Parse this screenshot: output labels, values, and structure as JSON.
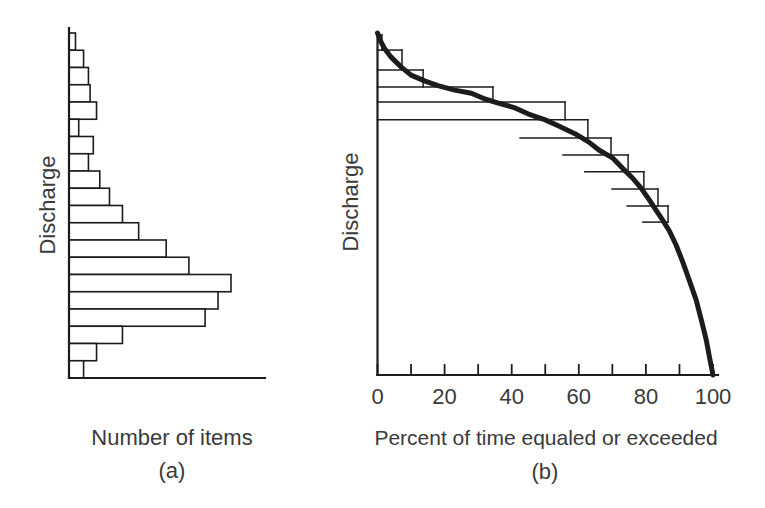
{
  "figure": {
    "background": "#ffffff",
    "line_color": "#1c1c1c",
    "text_color": "#3a3a3a"
  },
  "chart_data": [
    {
      "id": "a",
      "type": "bar",
      "orientation": "horizontal",
      "title": "",
      "xlabel": "Number of items",
      "ylabel": "Discharge",
      "caption": "(a)",
      "axis_numbers_shown": false,
      "grid": false,
      "value_units": "relative, max bar = 100",
      "values_top_to_bottom": [
        4,
        9,
        12,
        13,
        17,
        6,
        15,
        12,
        19,
        25,
        33,
        43,
        60,
        74,
        100,
        92,
        84,
        33,
        17,
        9
      ]
    },
    {
      "id": "b",
      "type": "line",
      "title": "",
      "xlabel": "Percent of time equaled or exceeded",
      "ylabel": "Discharge",
      "caption": "(b)",
      "grid": false,
      "xlim": [
        0,
        100
      ],
      "x_ticks": [
        0,
        20,
        40,
        60,
        80,
        100
      ],
      "x_minor_tick_step": 10,
      "y_axis_numbers_shown": false,
      "curve_note": "thick smooth flow-duration curve; y in relative discharge units (100 = axis top)",
      "curve": [
        [
          0,
          100
        ],
        [
          1,
          97.5
        ],
        [
          2,
          95.6
        ],
        [
          4,
          93.0
        ],
        [
          7,
          90.1
        ],
        [
          10,
          87.7
        ],
        [
          14,
          86.0
        ],
        [
          18,
          84.6
        ],
        [
          23,
          83.3
        ],
        [
          28,
          82.4
        ],
        [
          32,
          80.7
        ],
        [
          36,
          79.5
        ],
        [
          41,
          78.1
        ],
        [
          45,
          76.3
        ],
        [
          50,
          74.6
        ],
        [
          54,
          72.8
        ],
        [
          59,
          70.5
        ],
        [
          63,
          68.1
        ],
        [
          66,
          65.8
        ],
        [
          70,
          63.5
        ],
        [
          73,
          60.5
        ],
        [
          76,
          57.6
        ],
        [
          78.5,
          54.7
        ],
        [
          81,
          51.2
        ],
        [
          83,
          48.2
        ],
        [
          85,
          45.3
        ],
        [
          87,
          42.1
        ],
        [
          89,
          38.0
        ],
        [
          91,
          33.0
        ],
        [
          93,
          27.5
        ],
        [
          95,
          21.9
        ],
        [
          96.5,
          16.1
        ],
        [
          98,
          10.2
        ],
        [
          99,
          5.0
        ],
        [
          100,
          0
        ]
      ],
      "steps_full": [
        {
          "d": 99.4,
          "x2": 1.3
        },
        {
          "d": 95.0,
          "x2": 7.3
        },
        {
          "d": 89.2,
          "x2": 13.6
        },
        {
          "d": 84.2,
          "x2": 34.4
        },
        {
          "d": 79.8,
          "x2": 55.9
        },
        {
          "d": 74.6,
          "x2": 62.7
        }
      ],
      "steps_partial": [
        {
          "d": 69.3,
          "x1": 42.5,
          "x2": 69.6
        },
        {
          "d": 64.3,
          "x1": 55.3,
          "x2": 74.7
        },
        {
          "d": 59.4,
          "x1": 61.8,
          "x2": 79.4
        },
        {
          "d": 54.4,
          "x1": 69.9,
          "x2": 83.6
        },
        {
          "d": 49.4,
          "x1": 74.4,
          "x2": 86.6
        },
        {
          "d": 44.7,
          "x1": 79.1,
          "x2": 86.6
        }
      ],
      "steps_vertical": [
        {
          "x": 1.3,
          "d1": 99.4,
          "d2": 95.0
        },
        {
          "x": 7.3,
          "d1": 95.0,
          "d2": 89.2
        },
        {
          "x": 13.6,
          "d1": 89.2,
          "d2": 84.2
        },
        {
          "x": 34.4,
          "d1": 84.2,
          "d2": 79.8
        },
        {
          "x": 55.9,
          "d1": 79.8,
          "d2": 74.6
        },
        {
          "x": 62.7,
          "d1": 74.6,
          "d2": 69.3
        },
        {
          "x": 69.6,
          "d1": 69.3,
          "d2": 64.3
        },
        {
          "x": 74.7,
          "d1": 64.3,
          "d2": 59.4
        },
        {
          "x": 79.4,
          "d1": 59.4,
          "d2": 54.4
        },
        {
          "x": 83.6,
          "d1": 54.4,
          "d2": 49.4
        },
        {
          "x": 86.6,
          "d1": 49.4,
          "d2": 44.7
        }
      ]
    }
  ]
}
